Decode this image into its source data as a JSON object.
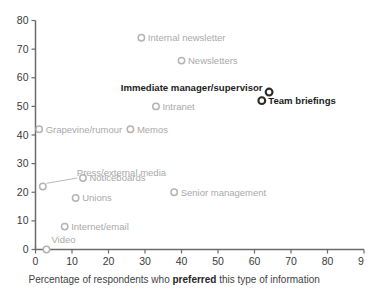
{
  "chart_data": {
    "type": "scatter",
    "title": "",
    "xlabel_plain_1": "Percentage of respondents who ",
    "xlabel_emphasis": "preferred",
    "xlabel_plain_2": " this type of information",
    "ylabel": "",
    "xlim": [
      0,
      90
    ],
    "ylim": [
      0,
      80
    ],
    "xticks": [
      "0",
      "10",
      "20",
      "30",
      "40",
      "50",
      "60",
      "70",
      "80",
      "9"
    ],
    "xtick_values": [
      0,
      10,
      20,
      30,
      40,
      50,
      60,
      70,
      80,
      90
    ],
    "yticks": [
      "0",
      "10",
      "20",
      "30",
      "40",
      "50",
      "60",
      "70",
      "80"
    ],
    "ytick_values": [
      0,
      10,
      20,
      30,
      40,
      50,
      60,
      70,
      80
    ],
    "grid": false,
    "legend": "none",
    "series": [
      {
        "name": "Other channels",
        "highlighted": false,
        "color": "#b4b4b4",
        "points": [
          {
            "label": "Internal newsletter",
            "x": 29,
            "y": 74,
            "label_pos": "right"
          },
          {
            "label": "Newsletters",
            "x": 40,
            "y": 66,
            "label_pos": "right"
          },
          {
            "label": "Intranet",
            "x": 33,
            "y": 50,
            "label_pos": "right"
          },
          {
            "label": "Grapevine/rumour",
            "x": 1,
            "y": 42,
            "label_pos": "right"
          },
          {
            "label": "Memos",
            "x": 26,
            "y": 42,
            "label_pos": "right"
          },
          {
            "label": "Noticeboards",
            "x": 13,
            "y": 25,
            "label_pos": "right"
          },
          {
            "label": "Press/external media",
            "x": 2,
            "y": 22,
            "label_pos": "leader"
          },
          {
            "label": "Senior management",
            "x": 38,
            "y": 20,
            "label_pos": "right"
          },
          {
            "label": "Unions",
            "x": 11,
            "y": 18,
            "label_pos": "right"
          },
          {
            "label": "Internet/email",
            "x": 8,
            "y": 8,
            "label_pos": "right"
          },
          {
            "label": "Video",
            "x": 3,
            "y": 0,
            "label_pos": "above"
          }
        ]
      },
      {
        "name": "Top channels",
        "highlighted": true,
        "color": "#2a2a2a",
        "points": [
          {
            "label": "Immediate manager/supervisor",
            "x": 64,
            "y": 55,
            "label_pos": "left"
          },
          {
            "label": "Team briefings",
            "x": 62,
            "y": 52,
            "label_pos": "right"
          }
        ]
      }
    ]
  },
  "colors": {
    "axis": "#6b6b6b",
    "marker_grey": "#b4b4b4",
    "marker_dark": "#2a2a2a",
    "label_grey": "#a9a9a9",
    "label_dark": "#1d1d1d",
    "background": "#ffffff"
  }
}
